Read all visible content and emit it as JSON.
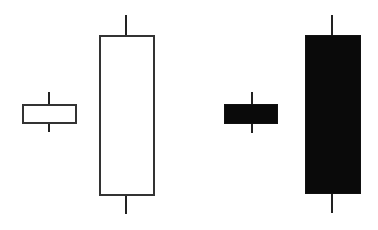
{
  "diagram": {
    "title": "",
    "colors": {
      "background": "#ffffff",
      "outline": "#333333",
      "filled": "#0a0a0a",
      "wick": "#222222"
    },
    "candles": [
      {
        "name": "small-white-candle",
        "fill": "white",
        "x": 22,
        "width": 55,
        "body_top": 104,
        "body_bottom": 124,
        "wick_top": 92,
        "wick_bottom": 132,
        "wick_x": 49
      },
      {
        "name": "tall-white-candle",
        "fill": "white",
        "x": 99,
        "width": 56,
        "body_top": 35,
        "body_bottom": 196,
        "wick_top": 15,
        "wick_bottom": 214,
        "wick_x": 126
      },
      {
        "name": "small-black-candle",
        "fill": "black",
        "x": 224,
        "width": 54,
        "body_top": 104,
        "body_bottom": 124,
        "wick_top": 92,
        "wick_bottom": 133,
        "wick_x": 252
      },
      {
        "name": "tall-black-candle",
        "fill": "black",
        "x": 305,
        "width": 56,
        "body_top": 35,
        "body_bottom": 194,
        "wick_top": 15,
        "wick_bottom": 213,
        "wick_x": 332
      }
    ]
  }
}
